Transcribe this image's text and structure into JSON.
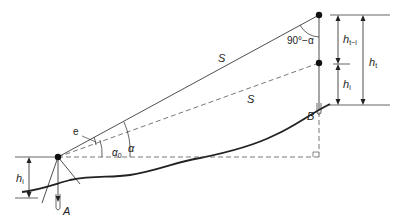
{
  "diagram": {
    "labels": {
      "slope_distance_top": "S",
      "slope_distance_bottom": "S",
      "complement_angle": "90°−α",
      "angle_alpha": "α",
      "angle_alpha0": "α",
      "angle_alpha0_sub": "0",
      "error_e": "e",
      "point_a": "A",
      "point_b": "B",
      "h_instrument": "h",
      "h_instrument_sub": "i",
      "h_target_left": "h",
      "h_target_left_sub": "i",
      "h_t_minus_i": "h",
      "h_t_minus_i_sub": "t−i",
      "h_total": "h",
      "h_total_sub": "t"
    },
    "colors": {
      "line": "#222222",
      "dashed": "#555555",
      "point": "#111111"
    }
  }
}
